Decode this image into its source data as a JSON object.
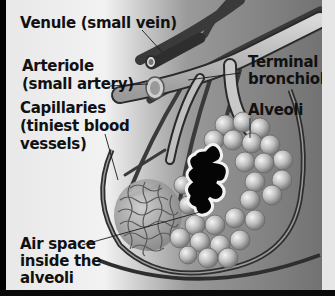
{
  "diagram": {
    "labels": {
      "venule": "Venule (small vein)",
      "arteriole_line1": "Arteriole",
      "arteriole_line2": "(small artery)",
      "terminal_line1": "Terminal",
      "terminal_line2": "bronchiole",
      "alveoli": "Alveoli",
      "capillaries_line1": "Capillaries",
      "capillaries_line2": "(tiniest blood",
      "capillaries_line3": "vessels)",
      "airspace_line1": "Air space",
      "airspace_line2": "inside the",
      "airspace_line3": "alveoli"
    },
    "colors": {
      "background_light": "#f0f0f0",
      "background_dark": "#6e6e6e",
      "vessel_dark": "#3a3a3a",
      "vessel_light": "#b8b8b8",
      "alveoli_sphere": "#c8c8c8",
      "air_space": "#050505",
      "text": "#111111"
    }
  }
}
